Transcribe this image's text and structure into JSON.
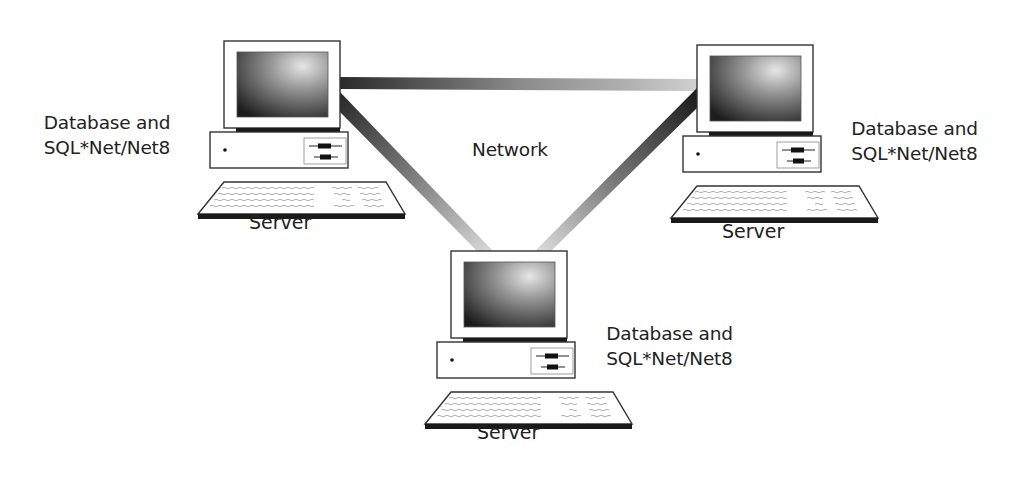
{
  "diagram": {
    "type": "network-topology",
    "network_label": "Network",
    "nodes": [
      {
        "id": "server-left",
        "name": "Server",
        "description_lines": [
          "Database and",
          "SQL*Net/Net8"
        ]
      },
      {
        "id": "server-right",
        "name": "Server",
        "description_lines": [
          "Database and",
          "SQL*Net/Net8"
        ]
      },
      {
        "id": "server-bottom",
        "name": "Server",
        "description_lines": [
          "Database and",
          "SQL*Net/Net8"
        ]
      }
    ],
    "links": [
      {
        "from": "server-left",
        "to": "server-right"
      },
      {
        "from": "server-left",
        "to": "server-bottom"
      },
      {
        "from": "server-right",
        "to": "server-bottom"
      }
    ],
    "colors": {
      "background": "#ffffff",
      "outline": "#333333",
      "link_dark": "#2a2a2a",
      "link_light": "#d8d8d8",
      "screen_dark": "#1e1e1e",
      "screen_light": "#e0e0e0",
      "text": "#222222"
    }
  }
}
